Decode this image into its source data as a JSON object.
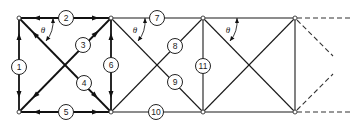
{
  "diagram": {
    "type": "truss",
    "angle_label": "θ",
    "nodes": [
      {
        "id": "A",
        "x": 19,
        "y": 18
      },
      {
        "id": "B",
        "x": 111,
        "y": 18
      },
      {
        "id": "C",
        "x": 203,
        "y": 18
      },
      {
        "id": "D",
        "x": 295,
        "y": 18
      },
      {
        "id": "E",
        "x": 19,
        "y": 112
      },
      {
        "id": "F",
        "x": 111,
        "y": 112
      },
      {
        "id": "G",
        "x": 203,
        "y": 112
      },
      {
        "id": "H",
        "x": 295,
        "y": 112
      }
    ],
    "members": [
      {
        "label": "1",
        "from": "A",
        "to": "E",
        "label_x": 19,
        "label_y": 67
      },
      {
        "label": "2",
        "from": "A",
        "to": "B",
        "label_x": 66,
        "label_y": 18
      },
      {
        "label": "3",
        "from": "E",
        "to": "B",
        "label_x": 83,
        "label_y": 45
      },
      {
        "label": "4",
        "from": "A",
        "to": "F",
        "label_x": 84,
        "label_y": 83
      },
      {
        "label": "5",
        "from": "E",
        "to": "F",
        "label_x": 66,
        "label_y": 112
      },
      {
        "label": "6",
        "from": "B",
        "to": "F",
        "label_x": 110,
        "label_y": 65
      },
      {
        "label": "7",
        "from": "B",
        "to": "C",
        "label_x": 157,
        "label_y": 18
      },
      {
        "label": "8",
        "from": "F",
        "to": "C",
        "label_x": 175,
        "label_y": 46
      },
      {
        "label": "9",
        "from": "B",
        "to": "G",
        "label_x": 175,
        "label_y": 82
      },
      {
        "label": "10",
        "from": "F",
        "to": "G",
        "label_x": 156,
        "label_y": 112
      },
      {
        "label": "11",
        "from": "C",
        "to": "G",
        "label_x": 203,
        "label_y": 66
      }
    ],
    "unlabeled_members": [
      {
        "from": "C",
        "to": "D"
      },
      {
        "from": "G",
        "to": "H"
      },
      {
        "from": "C",
        "to": "H"
      },
      {
        "from": "G",
        "to": "D"
      },
      {
        "from": "D",
        "to": "H"
      }
    ],
    "angles": [
      {
        "label": "θ",
        "x": 43,
        "y": 30
      },
      {
        "label": "θ",
        "x": 135,
        "y": 30
      },
      {
        "label": "θ",
        "x": 228,
        "y": 30
      }
    ]
  }
}
